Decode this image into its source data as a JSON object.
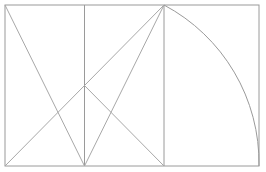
{
  "canvas": {
    "width": 266,
    "height": 172,
    "background_color": "#ffffff",
    "title": "Geometric construction: rectangle with diagonals and quarter arc"
  },
  "style": {
    "line_color": "#9a9a9a",
    "line_color_light": "#a8a8a8",
    "line_width": 1,
    "arc_color": "#9a9a9a",
    "fill": "none"
  },
  "geometry": {
    "outer_rectangle": {
      "label": "outer-rectangle",
      "x": 5,
      "y": 5,
      "width": 254,
      "height": 161,
      "left": 5,
      "top": 5,
      "right": 259,
      "bottom": 166
    },
    "base_square": {
      "label": "base-square",
      "left": 5,
      "top": 5,
      "right": 164,
      "bottom": 166,
      "side": 159
    },
    "points": {
      "top_left": {
        "x": 5,
        "y": 5
      },
      "top_mid": {
        "x": 84.5,
        "y": 5
      },
      "top_square_right": {
        "x": 164,
        "y": 5
      },
      "top_right": {
        "x": 259,
        "y": 5
      },
      "center": {
        "x": 84.5,
        "y": 85.5
      },
      "bottom_left": {
        "x": 5,
        "y": 166
      },
      "bottom_mid": {
        "x": 84.5,
        "y": 166
      },
      "bottom_square_right": {
        "x": 164,
        "y": 166
      },
      "bottom_right": {
        "x": 259,
        "y": 166
      }
    },
    "vertical_lines": [
      {
        "label": "mid-vertical",
        "x": 84.5,
        "y1": 5,
        "y2": 166
      },
      {
        "label": "square-right-vertical",
        "x": 164,
        "y1": 5,
        "y2": 166
      }
    ],
    "diagonals": [
      {
        "label": "diagonal-top-left-to-bottom-mid",
        "x1": 5,
        "y1": 5,
        "x2": 84.5,
        "y2": 166
      },
      {
        "label": "diagonal-bottom-left-to-top-square-right",
        "x1": 5,
        "y1": 166,
        "x2": 164,
        "y2": 5
      },
      {
        "label": "diagonal-top-square-right-to-bottom-mid",
        "x1": 164,
        "y1": 5,
        "x2": 84.5,
        "y2": 166
      },
      {
        "label": "diagonal-center-to-bottom-square-right",
        "x1": 84.5,
        "y1": 85.5,
        "x2": 164,
        "y2": 166
      }
    ],
    "arc": {
      "label": "quarter-arc",
      "start": {
        "x": 164,
        "y": 5
      },
      "end": {
        "x": 259,
        "y": 166
      },
      "center": {
        "x": 5,
        "y": 166
      },
      "radius": 179,
      "sweep": 1,
      "large_arc": 0,
      "description": "Arc centered at bottom-left corner swept from top of square-right vertical to bottom-right corner"
    }
  }
}
